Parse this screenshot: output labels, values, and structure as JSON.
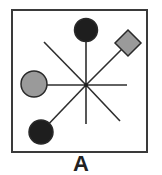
{
  "figure": {
    "label": "A",
    "colors": {
      "frame": "#3a3a3a",
      "line": "#2e2e2e",
      "black_marker": "#1e1e1e",
      "gray_marker": "#9a9a9a",
      "marker_stroke": "#2a2a2a",
      "background": "#ffffff"
    },
    "frame": {
      "x": 12,
      "y": 10,
      "width": 135,
      "height": 142
    },
    "center": {
      "x": 86,
      "y": 85
    },
    "spokes": [
      {
        "name": "spoke-up",
        "x2": 86,
        "y2": 30,
        "marker": "black-circle"
      },
      {
        "name": "spoke-up-right",
        "x2": 128,
        "y2": 43,
        "marker": "gray-diamond"
      },
      {
        "name": "spoke-right",
        "x2": 127,
        "y2": 85,
        "marker": "none"
      },
      {
        "name": "spoke-down-right",
        "x2": 120,
        "y2": 121,
        "marker": "none"
      },
      {
        "name": "spoke-down",
        "x2": 86,
        "y2": 124,
        "marker": "none"
      },
      {
        "name": "spoke-down-left",
        "x2": 41,
        "y2": 132,
        "marker": "black-circle"
      },
      {
        "name": "spoke-left",
        "x2": 34,
        "y2": 85,
        "marker": "gray-circle"
      },
      {
        "name": "spoke-up-left",
        "x2": 44,
        "y2": 42,
        "marker": "none"
      }
    ],
    "markers": [
      {
        "name": "top-black-circle",
        "shape": "circle",
        "cx": 86,
        "cy": 30,
        "r": 11.5,
        "fill": "black"
      },
      {
        "name": "top-right-gray-diamond",
        "shape": "diamond",
        "cx": 128,
        "cy": 43,
        "r": 13,
        "fill": "gray"
      },
      {
        "name": "left-gray-circle",
        "shape": "circle",
        "cx": 34,
        "cy": 84,
        "r": 13,
        "fill": "gray"
      },
      {
        "name": "bottom-left-black-circle",
        "shape": "circle",
        "cx": 41,
        "cy": 132,
        "r": 12,
        "fill": "black"
      }
    ]
  }
}
